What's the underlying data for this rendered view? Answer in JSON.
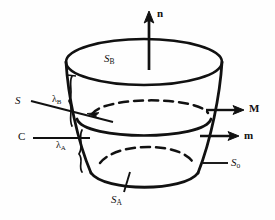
{
  "figure": {
    "type": "geometry-diagram",
    "ink_color": "#111111",
    "background_color": "#fefefe"
  },
  "labels": {
    "normal_vector": "n",
    "top_surface": "S",
    "top_surface_sub": "B",
    "bottom_surface": "S",
    "bottom_surface_sub": "A",
    "lateral_surface": "S",
    "lateral_surface_sub": "o",
    "surface_S": "S",
    "curve_C": "C",
    "vector_M": "M",
    "vector_m": "m",
    "lambda_B": "λ",
    "lambda_B_sub": "B",
    "lambda_A": "λ",
    "lambda_A_sub": "A"
  },
  "annotations": {
    "n_arrow": "upward-normal-arrow",
    "M_arrow": "right-arrow-M",
    "m_arrow": "right-arrow-m",
    "S_leader": "leader-line-to-dashed-ellipse",
    "C_leader": "leader-line-to-middle-ellipse",
    "So_leader": "leader-line-to-lateral-wall",
    "SA_leader": "tick-mark-to-bottom-arc",
    "lambda_B_brace": "brace-upper-band",
    "lambda_A_brace": "brace-lower-band"
  }
}
